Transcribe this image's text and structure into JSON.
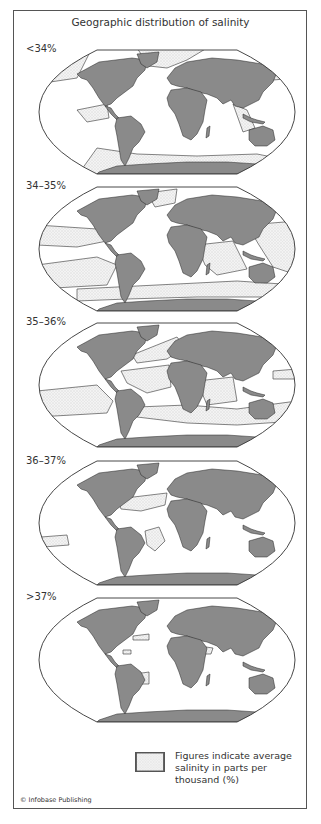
{
  "title": "Geographic distribution of salinity",
  "panels": [
    {
      "label": "<34%",
      "zones": "low"
    },
    {
      "label": "34–35%",
      "zones": "mid1"
    },
    {
      "label": "35–36%",
      "zones": "mid2"
    },
    {
      "label": "36–37%",
      "zones": "high1"
    },
    {
      "label": ">37%",
      "zones": "high2"
    }
  ],
  "legend": {
    "text": "Figures indicate average salinity in parts per thousand (%)",
    "swatch": "stippled-area"
  },
  "credit": "© Infobase Publishing",
  "colors": {
    "land": "#8a8a8a",
    "outline": "#333333",
    "ocean": "#ffffff",
    "stipple_bg": "#f2f2f2",
    "stipple_dot": "#b0b0b0"
  }
}
